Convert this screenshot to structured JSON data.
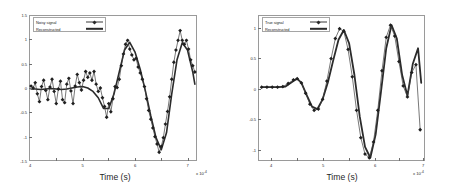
{
  "figure": {
    "background": "#ffffff",
    "panels": [
      {
        "id": "left",
        "legend": {
          "entries": [
            {
              "label": "Noisy signal",
              "style": "line-marker"
            },
            {
              "label": "Reconstructed",
              "style": "thick-line"
            }
          ]
        },
        "xlabel": "Time (s)",
        "ylabel": "",
        "x_exponent": "x 10",
        "x_exponent_sup": "-4",
        "xticks": [
          "4",
          "5",
          "6",
          "7"
        ],
        "yticks": [
          "1.5",
          "1",
          "0.5",
          "0",
          "-0.5",
          "-1",
          "-1.5"
        ]
      },
      {
        "id": "right",
        "legend": {
          "entries": [
            {
              "label": "True signal",
              "style": "line-marker"
            },
            {
              "label": "Reconstructed",
              "style": "thick-line"
            }
          ]
        },
        "xlabel": "Time (s)",
        "ylabel": "",
        "x_exponent": "x 10",
        "x_exponent_sup": "-4",
        "xticks": [
          "4",
          "5",
          "6",
          "7"
        ],
        "yticks": [
          "1",
          "0.5",
          "0",
          "-0.5",
          "-1"
        ]
      }
    ]
  },
  "chart_data": [
    {
      "type": "line",
      "title": "",
      "xlabel": "Time (s)",
      "ylabel": "",
      "xlim": [
        4.0,
        7.2
      ],
      "ylim": [
        -1.5,
        1.5
      ],
      "x_scale": "1e-4",
      "xticks": [
        4,
        5,
        6,
        7
      ],
      "yticks": [
        -1.5,
        -1,
        -0.5,
        0,
        0.5,
        1,
        1.5
      ],
      "grid": false,
      "legend_position": "upper-left",
      "series": [
        {
          "name": "Noisy signal",
          "marker": "diamond",
          "linewidth": 0.7,
          "x": [
            4.02,
            4.06,
            4.1,
            4.14,
            4.18,
            4.22,
            4.26,
            4.3,
            4.34,
            4.38,
            4.42,
            4.46,
            4.5,
            4.54,
            4.58,
            4.62,
            4.66,
            4.7,
            4.74,
            4.78,
            4.82,
            4.86,
            4.9,
            4.94,
            4.98,
            5.02,
            5.06,
            5.1,
            5.14,
            5.18,
            5.22,
            5.26,
            5.3,
            5.34,
            5.38,
            5.42,
            5.46,
            5.5,
            5.54,
            5.58,
            5.62,
            5.66,
            5.7,
            5.74,
            5.78,
            5.82,
            5.86,
            5.9,
            5.94,
            5.98,
            6.02,
            6.06,
            6.1,
            6.14,
            6.18,
            6.22,
            6.26,
            6.3,
            6.34,
            6.38,
            6.42,
            6.46,
            6.5,
            6.54,
            6.58,
            6.62,
            6.66,
            6.7,
            6.74,
            6.78,
            6.82,
            6.86,
            6.9,
            6.94,
            6.98,
            7.02,
            7.06,
            7.1,
            7.14
          ],
          "y": [
            0.06,
            0.02,
            0.13,
            -0.1,
            -0.26,
            0.05,
            0.18,
            -0.03,
            -0.22,
            0.04,
            0.2,
            -0.05,
            -0.3,
            0.0,
            0.16,
            -0.22,
            -0.28,
            0.1,
            0.22,
            -0.04,
            -0.3,
            0.06,
            0.3,
            0.13,
            -0.02,
            0.18,
            0.36,
            0.24,
            0.33,
            0.18,
            0.36,
            0.1,
            -0.05,
            0.02,
            -0.18,
            -0.36,
            -0.58,
            -0.3,
            -0.47,
            -0.2,
            0.05,
            0.03,
            0.2,
            0.48,
            0.72,
            0.92,
            1.0,
            0.82,
            0.7,
            0.6,
            0.63,
            0.45,
            0.33,
            0.2,
            0.05,
            -0.2,
            -0.44,
            -0.62,
            -0.8,
            -0.98,
            -1.13,
            -1.3,
            -1.18,
            -1.0,
            -0.72,
            -0.46,
            -0.16,
            0.2,
            0.55,
            0.8,
            1.0,
            1.2,
            1.0,
            0.92,
            1.0,
            0.82,
            0.6,
            0.48,
            0.35
          ]
        },
        {
          "name": "Reconstructed",
          "marker": "none",
          "linewidth": 1.6,
          "x": [
            4.02,
            4.1,
            4.2,
            4.3,
            4.4,
            4.5,
            4.6,
            4.7,
            4.8,
            4.9,
            5.0,
            5.1,
            5.2,
            5.3,
            5.4,
            5.5,
            5.6,
            5.7,
            5.8,
            5.9,
            6.0,
            6.1,
            6.2,
            6.3,
            6.4,
            6.5,
            6.6,
            6.7,
            6.8,
            6.9,
            7.0,
            7.1,
            7.14
          ],
          "y": [
            0.0,
            0.0,
            -0.01,
            0.0,
            0.01,
            0.0,
            -0.01,
            0.0,
            0.02,
            0.04,
            0.05,
            0.02,
            -0.05,
            -0.18,
            -0.4,
            -0.4,
            -0.1,
            0.35,
            0.8,
            0.96,
            0.76,
            0.4,
            -0.05,
            -0.55,
            -1.0,
            -1.25,
            -0.9,
            -0.1,
            0.6,
            0.95,
            0.8,
            0.35,
            0.1
          ]
        }
      ]
    },
    {
      "type": "line",
      "title": "",
      "xlabel": "Time (s)",
      "ylabel": "",
      "xlim": [
        3.9,
        7.05
      ],
      "ylim": [
        -1.25,
        1.15
      ],
      "x_scale": "1e-4",
      "xticks": [
        4,
        5,
        6,
        7
      ],
      "yticks": [
        -1,
        -0.5,
        0,
        0.5,
        1
      ],
      "grid": false,
      "legend_position": "upper-left",
      "series": [
        {
          "name": "True signal",
          "marker": "diamond",
          "linewidth": 0.7,
          "x": [
            3.95,
            4.05,
            4.15,
            4.25,
            4.35,
            4.45,
            4.55,
            4.62,
            4.7,
            4.78,
            4.86,
            4.94,
            5.02,
            5.1,
            5.18,
            5.26,
            5.34,
            5.42,
            5.5,
            5.58,
            5.66,
            5.74,
            5.82,
            5.9,
            5.98,
            6.06,
            6.14,
            6.22,
            6.3,
            6.38,
            6.46,
            6.54,
            6.62,
            6.7,
            6.78,
            6.86,
            6.94
          ],
          "y": [
            -0.02,
            -0.02,
            -0.02,
            -0.02,
            -0.01,
            0.04,
            0.1,
            0.12,
            0.05,
            -0.12,
            -0.3,
            -0.4,
            -0.38,
            -0.22,
            0.08,
            0.45,
            0.78,
            0.94,
            0.9,
            0.6,
            0.15,
            -0.4,
            -0.85,
            -1.12,
            -1.18,
            -0.92,
            -0.4,
            0.25,
            0.8,
            1.0,
            0.82,
            0.4,
            0.0,
            -0.18,
            0.22,
            0.35,
            -0.72
          ]
        },
        {
          "name": "Reconstructed",
          "marker": "none",
          "linewidth": 1.8,
          "x": [
            3.95,
            4.1,
            4.25,
            4.4,
            4.55,
            4.62,
            4.7,
            4.8,
            4.9,
            5.0,
            5.1,
            5.2,
            5.3,
            5.4,
            5.5,
            5.6,
            5.7,
            5.8,
            5.9,
            6.0,
            6.1,
            6.2,
            6.3,
            6.4,
            6.5,
            6.6,
            6.7,
            6.8,
            6.9,
            6.96
          ],
          "y": [
            -0.02,
            -0.02,
            -0.02,
            -0.01,
            0.08,
            0.12,
            0.05,
            -0.15,
            -0.34,
            -0.38,
            -0.22,
            0.06,
            0.42,
            0.76,
            0.92,
            0.7,
            0.18,
            -0.5,
            -1.0,
            -1.18,
            -0.8,
            -0.1,
            0.62,
            1.0,
            0.78,
            0.18,
            -0.16,
            0.36,
            0.62,
            0.05
          ]
        }
      ]
    }
  ]
}
